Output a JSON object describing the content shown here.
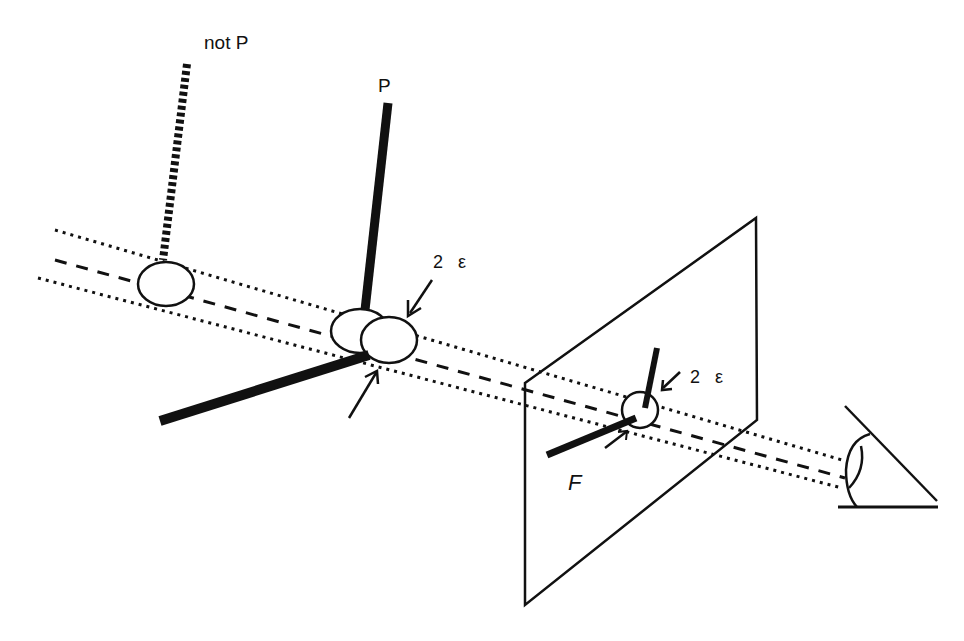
{
  "diagram": {
    "labels": {
      "not_p": "not P",
      "p": "P",
      "epsilon_top": "2 ε",
      "epsilon_plane": "2 ε",
      "figure": "F"
    },
    "elements": [
      {
        "id": "line-of-sight-tube",
        "style": "dotted boundary lines with dashed center line"
      },
      {
        "id": "not-p-figure",
        "style": "thick dashed vertical bar with ellipse cross-section"
      },
      {
        "id": "p-figure",
        "style": "thick solid bars meeting at overlapping ellipses"
      },
      {
        "id": "image-plane",
        "style": "parallelogram outline"
      },
      {
        "id": "projected-figure-f",
        "style": "two thick bars meeting in small circle"
      },
      {
        "id": "eye",
        "style": "eye symbol with viewing cone"
      }
    ],
    "colors": {
      "ink": "#111111",
      "background": "#ffffff"
    }
  }
}
